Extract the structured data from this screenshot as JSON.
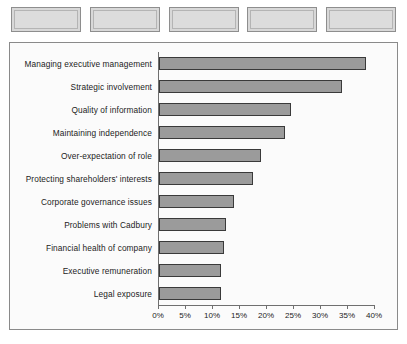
{
  "toolbar": {
    "buttons": [
      {
        "name": "toolbar-button-1",
        "label": ""
      },
      {
        "name": "toolbar-button-2",
        "label": ""
      },
      {
        "name": "toolbar-button-3",
        "label": ""
      },
      {
        "name": "toolbar-button-4",
        "label": ""
      },
      {
        "name": "toolbar-button-5",
        "label": ""
      }
    ]
  },
  "colors": {
    "bar_fill": "#9b9b9b",
    "bar_border": "#3a3a3a",
    "frame_border": "#8a8a8a",
    "plot_background": "#fbfbfb",
    "button_face": "#dcdcdc"
  },
  "chart_data": {
    "type": "bar",
    "orientation": "horizontal",
    "title": "",
    "xlabel": "",
    "ylabel": "",
    "xlim": [
      0,
      40
    ],
    "xtick_labels": [
      "0%",
      "5%",
      "10%",
      "15%",
      "20%",
      "25%",
      "30%",
      "35%",
      "40%"
    ],
    "xticks": [
      0,
      5,
      10,
      15,
      20,
      25,
      30,
      35,
      40
    ],
    "grid": false,
    "legend": false,
    "categories": [
      "Managing executive management",
      "Strategic involvement",
      "Quality of information",
      "Maintaining independence",
      "Over-expectation of role",
      "Protecting shareholders' interests",
      "Corporate governance issues",
      "Problems with Cadbury",
      "Financial health of company",
      "Executive remuneration",
      "Legal exposure"
    ],
    "values": [
      38.5,
      34,
      24.5,
      23.5,
      19,
      17.5,
      14,
      12.5,
      12,
      11.5,
      11.5
    ]
  }
}
